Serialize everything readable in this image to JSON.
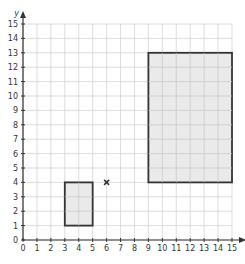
{
  "chart_data": {
    "type": "scatter",
    "title": "",
    "xlabel": "",
    "ylabel": "y",
    "xlim": [
      0,
      15
    ],
    "ylim": [
      0,
      15
    ],
    "x_ticks": [
      0,
      1,
      2,
      3,
      4,
      5,
      6,
      7,
      8,
      9,
      10,
      11,
      12,
      13,
      14,
      15
    ],
    "y_ticks": [
      0,
      1,
      2,
      3,
      4,
      5,
      6,
      7,
      8,
      9,
      10,
      11,
      12,
      13,
      14,
      15
    ],
    "grid": true,
    "shapes": [
      {
        "name": "small-rectangle",
        "type": "rectangle",
        "x0": 3,
        "y0": 1,
        "x1": 5,
        "y1": 4,
        "fill": "#e6e6e6",
        "stroke": "#333333"
      },
      {
        "name": "large-rectangle",
        "type": "rectangle",
        "x0": 9,
        "y0": 4,
        "x1": 15,
        "y1": 13,
        "fill": "#e6e6e6",
        "stroke": "#333333"
      }
    ],
    "points": [
      {
        "name": "center-of-enlargement",
        "marker": "×",
        "x": 6,
        "y": 4
      }
    ]
  },
  "colors": {
    "grid": "#d4d4d4",
    "axis": "#333333",
    "shape_fill": "#e6e6e6",
    "shape_stroke": "#333333"
  },
  "layout": {
    "origin_px": [
      23,
      240
    ],
    "x_max_px": 232,
    "y_max_px": 24
  }
}
